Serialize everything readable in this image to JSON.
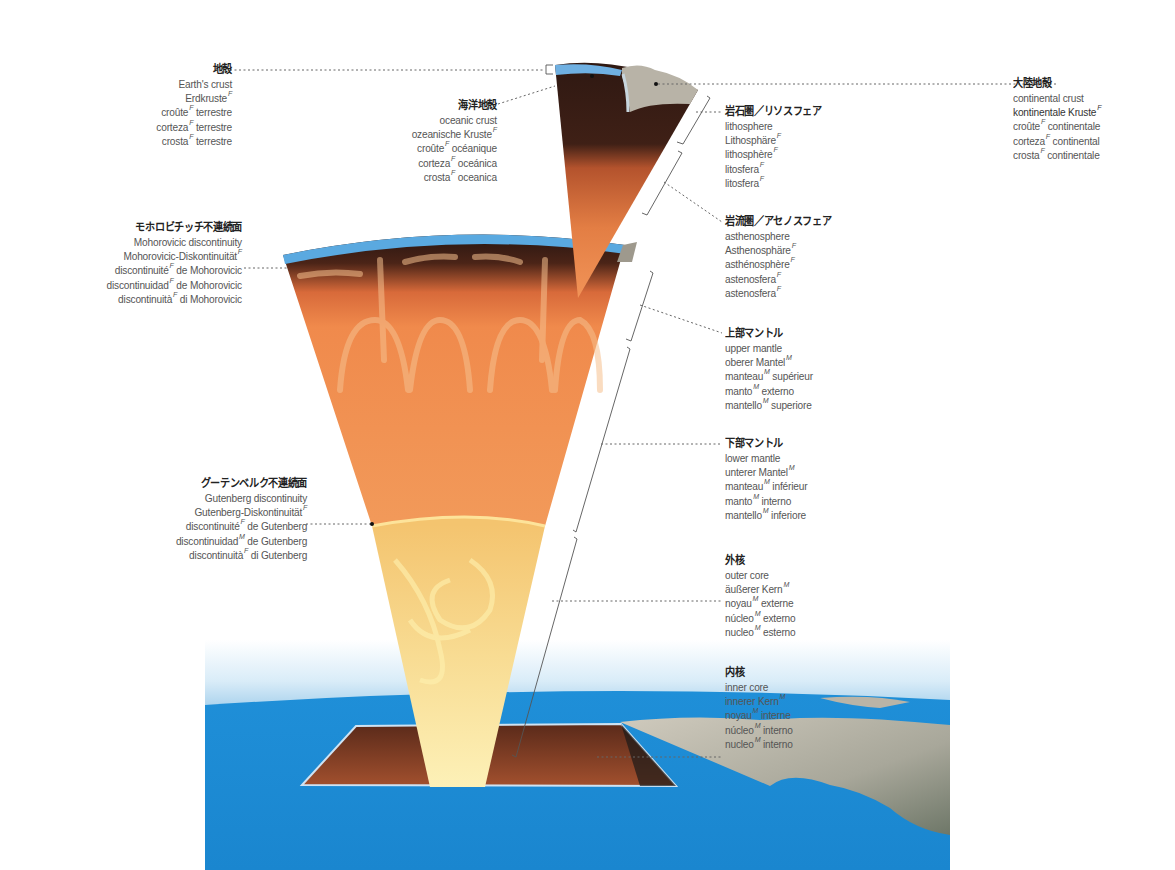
{
  "diagram": {
    "type": "earth-structure-cross-section",
    "colors": {
      "ocean": "#1d8fd6",
      "crust_blue": "#5aa9e0",
      "lithosphere_dark": "#3a1f17",
      "mantle_orange": "#f0894a",
      "outer_core": "#f4c774",
      "inner_core": "#fbeaa8",
      "continent": "#b9b4a7",
      "leader_line": "#555555"
    }
  },
  "labels": {
    "earth_crust": {
      "title": "地殻",
      "lines": [
        {
          "text": "Earth's crust",
          "g": ""
        },
        {
          "text": "Erdkruste",
          "g": "F"
        },
        {
          "text": "croûte",
          "g": "F",
          "rest": " terrestre"
        },
        {
          "text": "corteza",
          "g": "F",
          "rest": " terrestre"
        },
        {
          "text": "crosta",
          "g": "F",
          "rest": " terrestre"
        }
      ]
    },
    "oceanic_crust": {
      "title": "海洋地殻",
      "lines": [
        {
          "text": "oceanic crust",
          "g": ""
        },
        {
          "text": "ozeanische Kruste",
          "g": "F"
        },
        {
          "text": "croûte",
          "g": "F",
          "rest": " océanique"
        },
        {
          "text": "corteza",
          "g": "F",
          "rest": " oceánica"
        },
        {
          "text": "crosta",
          "g": "F",
          "rest": " oceanica"
        }
      ]
    },
    "continental_crust": {
      "title": "大陸地殻",
      "lines": [
        {
          "text": "continental crust",
          "g": ""
        },
        {
          "text": "kontinentale Kruste",
          "g": "F"
        },
        {
          "text": "croûte",
          "g": "F",
          "rest": " continentale"
        },
        {
          "text": "corteza",
          "g": "F",
          "rest": " continental"
        },
        {
          "text": "crosta",
          "g": "F",
          "rest": " continentale"
        }
      ]
    },
    "lithosphere": {
      "title": "岩石圏／リソスフェア",
      "lines": [
        {
          "text": "lithosphere",
          "g": ""
        },
        {
          "text": "Lithosphäre",
          "g": "F"
        },
        {
          "text": "lithosphère",
          "g": "F"
        },
        {
          "text": "litosfera",
          "g": "F"
        },
        {
          "text": "litosfera",
          "g": "F"
        }
      ]
    },
    "asthenosphere": {
      "title": "岩流圏／アセノスフェア",
      "lines": [
        {
          "text": "asthenosphere",
          "g": ""
        },
        {
          "text": "Asthenosphäre",
          "g": "F"
        },
        {
          "text": "asthénosphère",
          "g": "F"
        },
        {
          "text": "astenosfera",
          "g": "F"
        },
        {
          "text": "astenosfera",
          "g": "F"
        }
      ]
    },
    "mohorovicic": {
      "title": "モホロビチッチ不連続面",
      "lines": [
        {
          "text": "Mohorovicic discontinuity",
          "g": ""
        },
        {
          "text": "Mohorovicic-Diskontinuität",
          "g": "F"
        },
        {
          "text": "discontinuité",
          "g": "F",
          "rest": " de Mohorovicic"
        },
        {
          "text": "discontinuidad",
          "g": "F",
          "rest": " de Mohorovicic"
        },
        {
          "text": "discontinuità",
          "g": "F",
          "rest": " di Mohorovicic"
        }
      ]
    },
    "upper_mantle": {
      "title": "上部マントル",
      "lines": [
        {
          "text": "upper mantle",
          "g": ""
        },
        {
          "text": "oberer Mantel",
          "g": "M"
        },
        {
          "text": "manteau",
          "g": "M",
          "rest": " supérieur"
        },
        {
          "text": "manto",
          "g": "M",
          "rest": " externo"
        },
        {
          "text": "mantello",
          "g": "M",
          "rest": " superiore"
        }
      ]
    },
    "lower_mantle": {
      "title": "下部マントル",
      "lines": [
        {
          "text": "lower mantle",
          "g": ""
        },
        {
          "text": "unterer Mantel",
          "g": "M"
        },
        {
          "text": "manteau",
          "g": "M",
          "rest": " inférieur"
        },
        {
          "text": "manto",
          "g": "M",
          "rest": " interno"
        },
        {
          "text": "mantello",
          "g": "M",
          "rest": " inferiore"
        }
      ]
    },
    "gutenberg": {
      "title": "グーテンベルク不連続面",
      "lines": [
        {
          "text": "Gutenberg discontinuity",
          "g": ""
        },
        {
          "text": "Gutenberg-Diskontinuität",
          "g": "F"
        },
        {
          "text": "discontinuité",
          "g": "F",
          "rest": " de Gutenberg"
        },
        {
          "text": "discontinuidad",
          "g": "M",
          "rest": " de Gutenberg"
        },
        {
          "text": "discontinuità",
          "g": "F",
          "rest": " di Gutenberg"
        }
      ]
    },
    "outer_core": {
      "title": "外核",
      "lines": [
        {
          "text": "outer core",
          "g": ""
        },
        {
          "text": "äußerer Kern",
          "g": "M"
        },
        {
          "text": "noyau",
          "g": "M",
          "rest": " externe"
        },
        {
          "text": "núcleo",
          "g": "M",
          "rest": " externo"
        },
        {
          "text": "nucleo",
          "g": "M",
          "rest": " esterno"
        }
      ]
    },
    "inner_core": {
      "title": "内核",
      "lines": [
        {
          "text": "inner core",
          "g": ""
        },
        {
          "text": "innerer Kern",
          "g": "M"
        },
        {
          "text": "noyau",
          "g": "M",
          "rest": " interne"
        },
        {
          "text": "núcleo",
          "g": "M",
          "rest": " interno"
        },
        {
          "text": "nucleo",
          "g": "M",
          "rest": " interno"
        }
      ]
    }
  }
}
